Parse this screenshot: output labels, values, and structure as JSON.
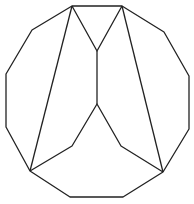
{
  "diagram": {
    "stroke_color": "#222222",
    "background": "#ffffff",
    "outline": {
      "points": [
        [
          72,
          6
        ],
        [
          122,
          6
        ],
        [
          164,
          32
        ],
        [
          189,
          76
        ],
        [
          189,
          129
        ],
        [
          163,
          172
        ],
        [
          123,
          197
        ],
        [
          70,
          197
        ],
        [
          30,
          171
        ],
        [
          6,
          127
        ],
        [
          6,
          74
        ],
        [
          32,
          30
        ]
      ]
    },
    "inner_lines": [
      {
        "points": [
          [
            72,
            6
          ],
          [
            97,
            51
          ],
          [
            122,
            6
          ]
        ]
      },
      {
        "points": [
          [
            97,
            51
          ],
          [
            97,
            104
          ]
        ]
      },
      {
        "points": [
          [
            30,
            171
          ],
          [
            72,
            146
          ],
          [
            97,
            104
          ],
          [
            121,
            146
          ],
          [
            163,
            172
          ]
        ]
      },
      {
        "points": [
          [
            72,
            6
          ],
          [
            30,
            171
          ]
        ]
      },
      {
        "points": [
          [
            122,
            6
          ],
          [
            163,
            172
          ]
        ]
      }
    ]
  }
}
